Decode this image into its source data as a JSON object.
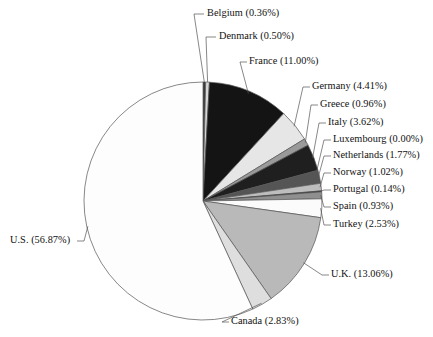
{
  "chart_data": {
    "type": "pie",
    "title": "",
    "subtitle": "",
    "xlabel": "",
    "ylabel": "",
    "legend_position": "none",
    "grid": false,
    "units": "percent",
    "start_angle_deg": 0,
    "direction": "clockwise",
    "categories": [
      "Belgium",
      "Denmark",
      "France",
      "Germany",
      "Greece",
      "Italy",
      "Luxembourg",
      "Netherlands",
      "Norway",
      "Portugal",
      "Spain",
      "Turkey",
      "U.K.",
      "Canada",
      "U.S."
    ],
    "values": [
      0.36,
      0.5,
      11.0,
      4.41,
      0.96,
      3.62,
      0.0,
      1.77,
      1.02,
      0.14,
      0.93,
      2.53,
      13.06,
      2.83,
      56.87
    ],
    "slices": [
      {
        "label": "Belgium",
        "value": 0.36,
        "label_text": "Belgium (0.36%)",
        "fill": "#3a3a3a"
      },
      {
        "label": "Denmark",
        "value": 0.5,
        "label_text": "Denmark (0.50%)",
        "fill": "#d8d8d8"
      },
      {
        "label": "France",
        "value": 11.0,
        "label_text": "France (11.00%)",
        "fill": "#141414"
      },
      {
        "label": "Germany",
        "value": 4.41,
        "label_text": "Germany (4.41%)",
        "fill": "#e6e6e6"
      },
      {
        "label": "Greece",
        "value": 0.96,
        "label_text": "Greece (0.96%)",
        "fill": "#9a9a9a"
      },
      {
        "label": "Italy",
        "value": 3.62,
        "label_text": "Italy (3.62%)",
        "fill": "#1f1f1f"
      },
      {
        "label": "Luxembourg",
        "value": 0.0,
        "label_text": "Luxembourg (0.00%)",
        "fill": "#ffffff"
      },
      {
        "label": "Netherlands",
        "value": 1.77,
        "label_text": "Netherlands (1.77%)",
        "fill": "#555555"
      },
      {
        "label": "Norway",
        "value": 1.02,
        "label_text": "Norway (1.02%)",
        "fill": "#bdbdbd"
      },
      {
        "label": "Portugal",
        "value": 0.14,
        "label_text": "Portugal (0.14%)",
        "fill": "#2a2a2a"
      },
      {
        "label": "Spain",
        "value": 0.93,
        "label_text": "Spain (0.93%)",
        "fill": "#8f8f8f"
      },
      {
        "label": "Turkey",
        "value": 2.53,
        "label_text": "Turkey (2.53%)",
        "fill": "#fbfbfb"
      },
      {
        "label": "U.K.",
        "value": 13.06,
        "label_text": "U.K. (13.06%)",
        "fill": "#b9b9b9"
      },
      {
        "label": "Canada",
        "value": 2.83,
        "label_text": "Canada (2.83%)",
        "fill": "#dedede"
      },
      {
        "label": "U.S.",
        "value": 56.87,
        "label_text": "U.S. (56.87%)",
        "fill": "#fdfdfd"
      }
    ],
    "colors": {
      "background": "#ffffff",
      "outline": "#555555",
      "leader_line": "#555555",
      "text": "#111111"
    },
    "geometry": {
      "cx": 203,
      "cy": 201,
      "r": 119
    }
  },
  "labels": {
    "belgium": "Belgium (0.36%)",
    "denmark": "Denmark (0.50%)",
    "france": "France (11.00%)",
    "germany": "Germany (4.41%)",
    "greece": "Greece (0.96%)",
    "italy": "Italy (3.62%)",
    "luxembourg": "Luxembourg (0.00%)",
    "netherlands": "Netherlands (1.77%)",
    "norway": "Norway (1.02%)",
    "portugal": "Portugal (0.14%)",
    "spain": "Spain (0.93%)",
    "turkey": "Turkey (2.53%)",
    "uk": "U.K. (13.06%)",
    "canada": "Canada (2.83%)",
    "us": "U.S. (56.87%)"
  }
}
